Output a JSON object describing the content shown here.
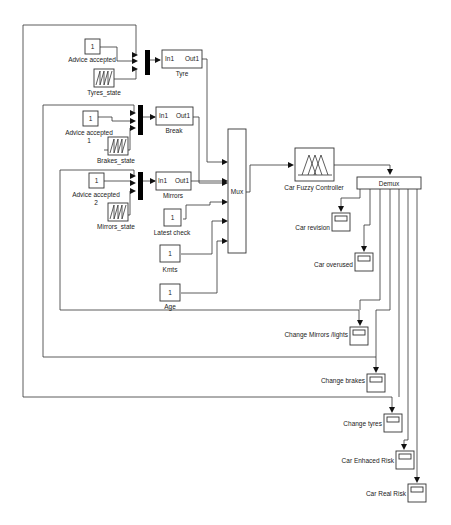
{
  "diagram": {
    "type": "simulink-block-diagram",
    "sources": {
      "advice_accepted_tyre": {
        "label": "Advice accepted",
        "value": "1"
      },
      "tyres_state": {
        "label": "Tyres_state"
      },
      "advice_accepted_break": {
        "label": "Advice accepted",
        "label2": "1",
        "value": "1"
      },
      "brakes_state": {
        "label": "Brakes_state"
      },
      "advice_accepted_mirrors": {
        "label": "Advice accepted",
        "label2": "2",
        "value": "1"
      },
      "mirrors_state": {
        "label": "Mirrors_state"
      },
      "latest_check": {
        "label": "Latest check",
        "value": "1"
      },
      "kmts": {
        "label": "Kmts",
        "value": "1"
      },
      "age": {
        "label": "Age",
        "value": "1"
      }
    },
    "subsystems": {
      "tyre": {
        "label": "Tyre",
        "in": "In1",
        "out": "Out1"
      },
      "break": {
        "label": "Break",
        "in": "In1",
        "out": "Out1"
      },
      "mirrors": {
        "label": "Mirrors",
        "in": "In1",
        "out": "Out1"
      }
    },
    "mux": {
      "label": "Mux"
    },
    "controller": {
      "label": "Car Fuzzy Controller"
    },
    "demux": {
      "label": "Demux"
    },
    "scopes": [
      {
        "label": "Car revision"
      },
      {
        "label": "Car overused"
      },
      {
        "label": "Change Mirrors /lights"
      },
      {
        "label": "Change brakes"
      },
      {
        "label": "Change tyres"
      },
      {
        "label": "Car Enhaced Risk"
      },
      {
        "label": "Car Real Risk"
      }
    ],
    "colors": {
      "line": "#333333",
      "background": "#ffffff",
      "text": "#222222"
    }
  }
}
